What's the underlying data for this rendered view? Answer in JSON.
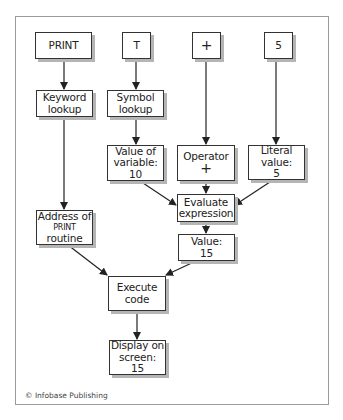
{
  "diagram": {
    "inputs": {
      "print": "PRINT",
      "t": "T",
      "plus": "+",
      "five": "5"
    },
    "nodes": {
      "keyword_lookup": [
        "Keyword",
        "lookup"
      ],
      "symbol_lookup": [
        "Symbol",
        "lookup"
      ],
      "value_of_variable": [
        "Value of",
        "variable:",
        "10"
      ],
      "operator": [
        "Operator",
        "+"
      ],
      "literal_value": [
        "Literal",
        "value:",
        "5"
      ],
      "evaluate_expression": [
        "Evaluate",
        "expression"
      ],
      "address_of_print": [
        "Address of",
        "PRINT",
        "routine"
      ],
      "value_15": [
        "Value:",
        "15"
      ],
      "execute_code": [
        "Execute",
        "code"
      ],
      "display_on_screen": [
        "Display on",
        "screen:",
        "15"
      ]
    },
    "edges": [
      [
        "PRINT",
        "Keyword lookup"
      ],
      [
        "T",
        "Symbol lookup"
      ],
      [
        "+",
        "Operator +"
      ],
      [
        "5",
        "Literal value: 5"
      ],
      [
        "Keyword lookup",
        "Address of PRINT routine"
      ],
      [
        "Symbol lookup",
        "Value of variable: 10"
      ],
      [
        "Value of variable: 10",
        "Evaluate expression"
      ],
      [
        "Operator +",
        "Evaluate expression"
      ],
      [
        "Literal value: 5",
        "Evaluate expression"
      ],
      [
        "Evaluate expression",
        "Value: 15"
      ],
      [
        "Address of PRINT routine",
        "Execute code"
      ],
      [
        "Value: 15",
        "Execute code"
      ],
      [
        "Execute code",
        "Display on screen: 15"
      ]
    ],
    "credit": "© Infobase Publishing",
    "colors": {
      "frame": "#9a9a9a",
      "box_border": "#333333",
      "shadow": "#b5b5b5",
      "arrow": "#222222"
    }
  }
}
